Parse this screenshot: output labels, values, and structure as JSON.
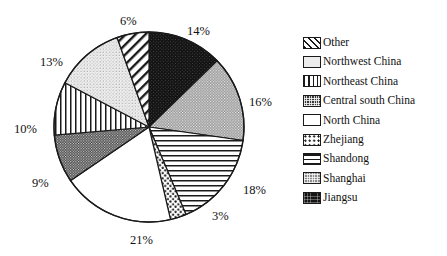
{
  "chart_data": {
    "type": "pie",
    "title": "",
    "categories": [
      "Jiangsu",
      "Shanghai",
      "Shandong",
      "Zhejiang",
      "North China",
      "Central south China",
      "Northeast China",
      "Northwest China",
      "Other"
    ],
    "values": [
      14,
      16,
      18,
      3,
      21,
      9,
      10,
      13,
      6
    ],
    "value_labels": [
      "14%",
      "16%",
      "18%",
      "3%",
      "21%",
      "9%",
      "10%",
      "13%",
      "6%"
    ],
    "units": "percent",
    "start_angle_deg": 0,
    "direction": "clockwise",
    "legend_position": "right",
    "grid": false,
    "xlabel": "",
    "ylabel": ""
  },
  "pie": {
    "center_x": 149,
    "center_y": 127,
    "radius": 95,
    "outline_color": "#1a1a1a",
    "slices": [
      {
        "name": "Jiangsu",
        "label": "14%",
        "value": 14,
        "pattern": "solid-black",
        "label_x": 187,
        "label_y": 24
      },
      {
        "name": "Shanghai",
        "label": "16%",
        "value": 16,
        "pattern": "gray-checker",
        "label_x": 249,
        "label_y": 95
      },
      {
        "name": "Shandong",
        "label": "18%",
        "value": 18,
        "pattern": "horizontal",
        "label_x": 243,
        "label_y": 183
      },
      {
        "name": "Zhejiang",
        "label": "3%",
        "value": 3,
        "pattern": "coarse-dots",
        "label_x": 212,
        "label_y": 209
      },
      {
        "name": "North China",
        "label": "21%",
        "value": 21,
        "pattern": "white",
        "label_x": 130,
        "label_y": 233
      },
      {
        "name": "Central south China",
        "label": "9%",
        "value": 9,
        "pattern": "dark-checker",
        "label_x": 32,
        "label_y": 176
      },
      {
        "name": "Northeast China",
        "label": "10%",
        "value": 10,
        "pattern": "vertical",
        "label_x": 14,
        "label_y": 122
      },
      {
        "name": "Northwest China",
        "label": "13%",
        "value": 13,
        "pattern": "light-stipple",
        "label_x": 40,
        "label_y": 55
      },
      {
        "name": "Other",
        "label": "6%",
        "value": 6,
        "pattern": "diagonal-hatch",
        "label_x": 120,
        "label_y": 14
      }
    ]
  },
  "legend": {
    "items": [
      {
        "label": "Other",
        "pattern": "diagonal-hatch",
        "swatch_class": "sw-diag"
      },
      {
        "label": "Northwest China",
        "pattern": "light-stipple",
        "swatch_class": "sw-lightdot"
      },
      {
        "label": "Northeast China",
        "pattern": "vertical",
        "swatch_class": "sw-vert"
      },
      {
        "label": "Central south China",
        "pattern": "dark-checker",
        "swatch_class": "sw-darkcheck"
      },
      {
        "label": "North China",
        "pattern": "white",
        "swatch_class": "sw-white"
      },
      {
        "label": "Zhejiang",
        "pattern": "coarse-dots",
        "swatch_class": "sw-dots"
      },
      {
        "label": "Shandong",
        "pattern": "horizontal",
        "swatch_class": "sw-horiz"
      },
      {
        "label": "Shanghai",
        "pattern": "gray-checker",
        "swatch_class": "sw-graycheck"
      },
      {
        "label": "Jiangsu",
        "pattern": "solid-black",
        "swatch_class": "sw-black"
      }
    ]
  }
}
